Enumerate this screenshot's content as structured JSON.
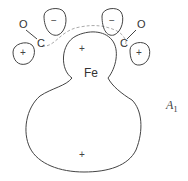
{
  "diagram": {
    "labels": {
      "left_oxygen": "O",
      "left_carbon": "C",
      "right_oxygen": "O",
      "right_carbon": "C",
      "metal": "Fe",
      "orbital_name": "A",
      "orbital_subscript": "1"
    },
    "signs": {
      "left_co_minus": "−",
      "left_co_plus": "+",
      "right_co_minus": "−",
      "right_co_plus": "+",
      "fe_top_lobe": "+",
      "fe_bottom_lobe": "+"
    },
    "colors": {
      "line": "#444444",
      "dashed": "#aaaaaa",
      "background": "#ffffff"
    }
  }
}
